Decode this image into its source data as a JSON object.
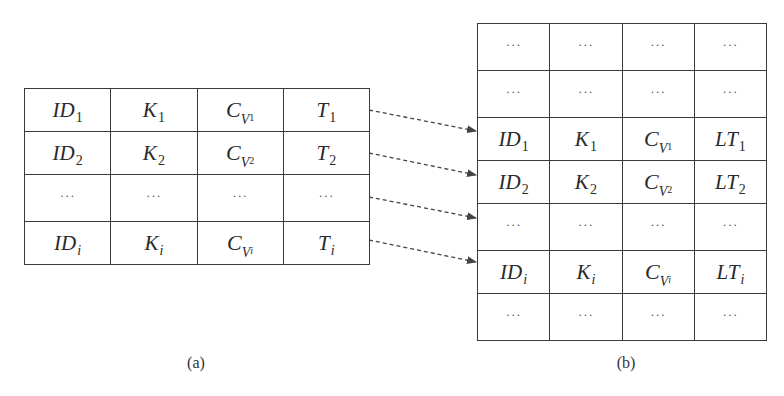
{
  "diagram": {
    "table_a": {
      "caption": "(a)",
      "columns": [
        "ID",
        "K",
        "C_V",
        "T"
      ],
      "rows": [
        {
          "type": "entry",
          "id": {
            "base": "ID",
            "sub": "1"
          },
          "k": {
            "base": "K",
            "sub": "1"
          },
          "c": {
            "base": "C",
            "v": "V",
            "sub": "1"
          },
          "t": {
            "base": "T",
            "sub": "1"
          }
        },
        {
          "type": "entry",
          "id": {
            "base": "ID",
            "sub": "2"
          },
          "k": {
            "base": "K",
            "sub": "2"
          },
          "c": {
            "base": "C",
            "v": "V",
            "sub": "2"
          },
          "t": {
            "base": "T",
            "sub": "2"
          }
        },
        {
          "type": "ellipsis",
          "cells": [
            "···",
            "···",
            "···",
            "···"
          ]
        },
        {
          "type": "entry",
          "id": {
            "base": "ID",
            "sub": "i"
          },
          "k": {
            "base": "K",
            "sub": "i"
          },
          "c": {
            "base": "C",
            "v": "V",
            "sub": "i"
          },
          "t": {
            "base": "T",
            "sub": "i"
          }
        }
      ]
    },
    "table_b": {
      "caption": "(b)",
      "columns": [
        "ID",
        "K",
        "C_V",
        "LT"
      ],
      "rows": [
        {
          "type": "ellipsis",
          "cells": [
            "···",
            "···",
            "···",
            "···"
          ]
        },
        {
          "type": "ellipsis",
          "cells": [
            "···",
            "···",
            "···",
            "···"
          ]
        },
        {
          "type": "entry",
          "id": {
            "base": "ID",
            "sub": "1"
          },
          "k": {
            "base": "K",
            "sub": "1"
          },
          "c": {
            "base": "C",
            "v": "V",
            "sub": "1"
          },
          "t": {
            "base": "LT",
            "sub": "1"
          }
        },
        {
          "type": "entry",
          "id": {
            "base": "ID",
            "sub": "2"
          },
          "k": {
            "base": "K",
            "sub": "2"
          },
          "c": {
            "base": "C",
            "v": "V",
            "sub": "2"
          },
          "t": {
            "base": "LT",
            "sub": "2"
          }
        },
        {
          "type": "ellipsis",
          "cells": [
            "···",
            "···",
            "···",
            "···"
          ]
        },
        {
          "type": "entry",
          "id": {
            "base": "ID",
            "sub": "i"
          },
          "k": {
            "base": "K",
            "sub": "i"
          },
          "c": {
            "base": "C",
            "v": "V",
            "sub": "i"
          },
          "t": {
            "base": "LT",
            "sub": "i"
          }
        },
        {
          "type": "ellipsis",
          "cells": [
            "···",
            "···",
            "···",
            "···"
          ]
        }
      ]
    },
    "arrows": [
      {
        "from_row": "table_a.row0",
        "to_row": "table_b.row2",
        "x1": 369,
        "y1": 110,
        "x2": 477,
        "y2": 131
      },
      {
        "from_row": "table_a.row1",
        "to_row": "table_b.row3",
        "x1": 369,
        "y1": 153,
        "x2": 477,
        "y2": 175
      },
      {
        "from_row": "table_a.row2",
        "to_row": "table_b.row4",
        "x1": 369,
        "y1": 197,
        "x2": 477,
        "y2": 218
      },
      {
        "from_row": "table_a.row3",
        "to_row": "table_b.row5",
        "x1": 369,
        "y1": 240,
        "x2": 477,
        "y2": 262
      }
    ],
    "colors": {
      "line": "#3a3a3a",
      "text": "#2a2a2a",
      "arrow": "#444444",
      "background": "#ffffff"
    }
  }
}
